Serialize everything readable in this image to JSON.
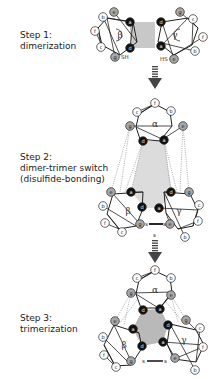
{
  "steps": [
    {
      "title": "Step 1:",
      "lines": [
        "dimerization"
      ],
      "top": 30
    },
    {
      "title": "Step 2:",
      "lines": [
        "dimer-trimer switch",
        "(disulfide-bonding)"
      ],
      "top": 152
    },
    {
      "title": "Step 3:",
      "lines": [
        "trimerization"
      ],
      "top": 313
    }
  ],
  "colors": {
    "core_fill": "#c8c8c8",
    "a_d_fill": "#111111",
    "e_g_fill": "#a8a8a8",
    "outer_fill": "#ffffff",
    "line": "#222222",
    "dotted": "#888888"
  },
  "labels": {
    "sh": "SH",
    "hs": "HS",
    "s": "s",
    "alpha": "α",
    "beta": "β",
    "gamma": "γ"
  },
  "step1": {
    "core": [
      [
        130,
        22
      ],
      [
        155,
        22
      ],
      [
        155,
        48
      ],
      [
        130,
        48
      ]
    ],
    "helices": [
      {
        "name": "beta",
        "label": "β",
        "cx": 120,
        "cy": 35,
        "poly": [
          [
            107,
            18
          ],
          [
            133,
            22
          ],
          [
            137,
            42
          ],
          [
            120,
            55
          ],
          [
            102,
            45
          ],
          [
            98,
            28
          ]
        ],
        "nodes": [
          [
            "a",
            130,
            22,
            "k"
          ],
          [
            "d",
            130,
            48,
            "k"
          ],
          [
            "e",
            114,
            12,
            "g"
          ],
          [
            "b",
            103,
            17,
            "w"
          ],
          [
            "f",
            95,
            31,
            "w"
          ],
          [
            "c",
            101,
            47,
            "w"
          ],
          [
            "g",
            115,
            57,
            "g"
          ]
        ]
      },
      {
        "name": "gamma",
        "label": "γ",
        "cx": 175,
        "cy": 35,
        "poly": [
          [
            162,
            22
          ],
          [
            188,
            18
          ],
          [
            198,
            28
          ],
          [
            192,
            45
          ],
          [
            174,
            55
          ],
          [
            158,
            42
          ]
        ],
        "nodes": [
          [
            "d",
            161,
            22,
            "k"
          ],
          [
            "a",
            161,
            46,
            "k"
          ],
          [
            "g",
            180,
            12,
            "g"
          ],
          [
            "c",
            193,
            19,
            "w"
          ],
          [
            "f",
            203,
            37,
            "w"
          ],
          [
            "b",
            195,
            51,
            "w"
          ],
          [
            "e",
            174,
            59,
            "g"
          ]
        ]
      }
    ]
  },
  "step2": {
    "alpha": {
      "label": "α",
      "cx": 155,
      "cy": 124,
      "poly": [
        [
          139,
          114
        ],
        [
          155,
          104
        ],
        [
          170,
          112
        ],
        [
          172,
          126
        ],
        [
          160,
          141
        ],
        [
          140,
          139
        ],
        [
          136,
          127
        ]
      ],
      "nodes": [
        [
          "f",
          155,
          103,
          "w"
        ],
        [
          "c",
          137,
          112,
          "w"
        ],
        [
          "b",
          171,
          111,
          "w"
        ],
        [
          "g",
          130,
          126,
          "g"
        ],
        [
          "e",
          183,
          126,
          "g"
        ],
        [
          "d",
          143,
          141,
          "k"
        ],
        [
          "a",
          164,
          140,
          "k"
        ]
      ]
    },
    "beta": {
      "label": "β",
      "cx": 128,
      "cy": 211,
      "poly": [
        [
          113,
          194
        ],
        [
          143,
          192
        ],
        [
          142,
          211
        ],
        [
          136,
          226
        ],
        [
          119,
          229
        ],
        [
          107,
          214
        ]
      ],
      "nodes": [
        [
          "e",
          111,
          192,
          "g"
        ],
        [
          "a",
          131,
          192,
          "k"
        ],
        [
          "d",
          142,
          207,
          "k"
        ],
        [
          "b",
          103,
          206,
          "w"
        ],
        [
          "f",
          105,
          223,
          "w"
        ],
        [
          "c",
          122,
          232,
          "w"
        ],
        [
          "g",
          140,
          224,
          "g"
        ]
      ]
    },
    "gamma": {
      "label": "γ",
      "cx": 179,
      "cy": 211,
      "poly": [
        [
          164,
          192
        ],
        [
          190,
          194
        ],
        [
          198,
          210
        ],
        [
          193,
          226
        ],
        [
          178,
          229
        ],
        [
          166,
          213
        ]
      ],
      "nodes": [
        [
          "d",
          171,
          192,
          "k"
        ],
        [
          "g",
          189,
          192,
          "g"
        ],
        [
          "a",
          159,
          208,
          "k"
        ],
        [
          "c",
          199,
          205,
          "w"
        ],
        [
          "f",
          198,
          221,
          "w"
        ],
        [
          "e",
          170,
          224,
          "g"
        ],
        [
          "b",
          185,
          237,
          "w"
        ]
      ]
    },
    "core": [
      [
        143,
        141
      ],
      [
        164,
        140
      ],
      [
        172,
        192
      ],
      [
        160,
        208
      ],
      [
        145,
        208
      ],
      [
        131,
        192
      ]
    ]
  },
  "step3": {
    "alpha": {
      "label": "α",
      "cx": 155,
      "cy": 290,
      "poly": [
        [
          139,
          280
        ],
        [
          155,
          271
        ],
        [
          170,
          278
        ],
        [
          172,
          292
        ],
        [
          160,
          308
        ],
        [
          141,
          308
        ],
        [
          136,
          294
        ]
      ],
      "nodes": [
        [
          "f",
          155,
          270,
          "w"
        ],
        [
          "c",
          137,
          278,
          "w"
        ],
        [
          "b",
          171,
          278,
          "w"
        ],
        [
          "g",
          131,
          293,
          "g"
        ],
        [
          "e",
          171,
          295,
          "g"
        ],
        [
          "d",
          143,
          310,
          "k"
        ],
        [
          "a",
          160,
          309,
          "k"
        ]
      ]
    },
    "beta": {
      "label": "β",
      "cx": 124,
      "cy": 345,
      "poly": [
        [
          114,
          325
        ],
        [
          139,
          333
        ],
        [
          142,
          348
        ],
        [
          131,
          365
        ],
        [
          115,
          366
        ],
        [
          104,
          345
        ]
      ],
      "nodes": [
        [
          "e",
          115,
          321,
          "g"
        ],
        [
          "a",
          133,
          329,
          "k"
        ],
        [
          "d",
          142,
          346,
          "k"
        ],
        [
          "b",
          103,
          337,
          "w"
        ],
        [
          "f",
          104,
          355,
          "w"
        ],
        [
          "c",
          116,
          367,
          "w"
        ],
        [
          "g",
          131,
          361,
          "g"
        ]
      ]
    },
    "gamma": {
      "label": "γ",
      "cx": 184,
      "cy": 340,
      "poly": [
        [
          170,
          324
        ],
        [
          196,
          330
        ],
        [
          204,
          345
        ],
        [
          196,
          362
        ],
        [
          174,
          359
        ],
        [
          167,
          344
        ]
      ],
      "nodes": [
        [
          "d",
          168,
          325,
          "k"
        ],
        [
          "g",
          186,
          320,
          "g"
        ],
        [
          "a",
          163,
          342,
          "k"
        ],
        [
          "c",
          200,
          328,
          "w"
        ],
        [
          "f",
          203,
          347,
          "w"
        ],
        [
          "e",
          175,
          358,
          "g"
        ],
        [
          "b",
          195,
          370,
          "w"
        ]
      ]
    },
    "core": [
      [
        143,
        310
      ],
      [
        160,
        309
      ],
      [
        168,
        325
      ],
      [
        163,
        342
      ],
      [
        142,
        346
      ],
      [
        133,
        329
      ]
    ]
  }
}
